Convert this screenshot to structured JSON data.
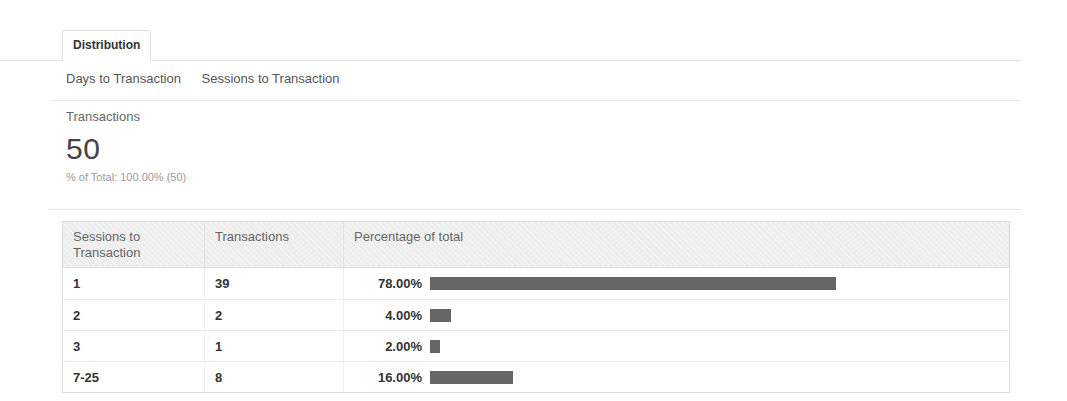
{
  "tabs": [
    {
      "label": "Distribution",
      "active": true
    }
  ],
  "subnav": [
    {
      "label": "Days to Transaction",
      "selected": false
    },
    {
      "label": "Sessions to Transaction",
      "selected": true
    }
  ],
  "summary": {
    "metric_label": "Transactions",
    "value": "50",
    "percent_of_total": "% of Total: 100.00% (50)"
  },
  "chart_data": {
    "type": "table",
    "columns": [
      "Sessions to Transaction",
      "Transactions",
      "Percentage of total"
    ],
    "rows": [
      {
        "dimension": "1",
        "transactions": "39",
        "percent": 78,
        "percent_label": "78.00%"
      },
      {
        "dimension": "2",
        "transactions": "2",
        "percent": 4,
        "percent_label": "4.00%"
      },
      {
        "dimension": "3",
        "transactions": "1",
        "percent": 2,
        "percent_label": "2.00%"
      },
      {
        "dimension": "7-25",
        "transactions": "8",
        "percent": 16,
        "percent_label": "16.00%"
      }
    ],
    "total_percent": 100,
    "bar_color": "#666666"
  },
  "colors": {
    "bar": "#666666",
    "table_border": "#dcdcdc",
    "header_bg": "#f2f2f2",
    "accent_text": "#333333"
  }
}
